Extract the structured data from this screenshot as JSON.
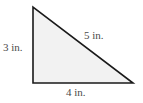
{
  "figure": {
    "type": "right-triangle",
    "fill_color": "#f2f2f2",
    "stroke_color": "#1a1a1a",
    "vertices": {
      "top": [
        33,
        7
      ],
      "bottom_left": [
        33,
        83
      ],
      "bottom_right": [
        133,
        83
      ]
    },
    "labels": {
      "left_side": "3 in.",
      "hypotenuse": "5 in.",
      "bottom_side": "4 in."
    }
  }
}
